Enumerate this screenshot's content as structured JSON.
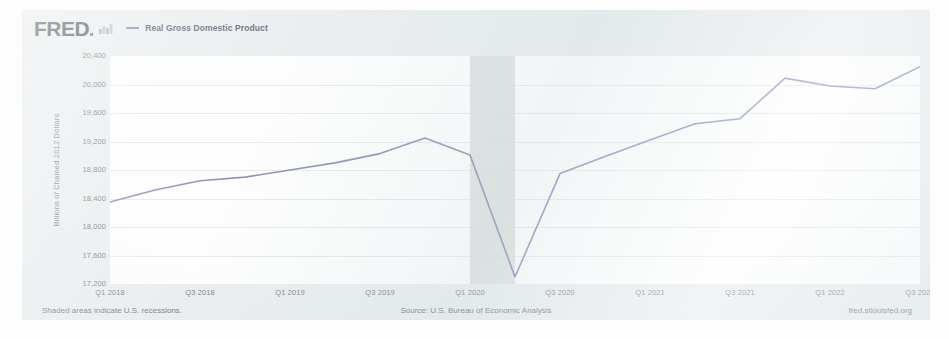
{
  "card": {
    "logo_text": "FRED",
    "logo_icon": "mini-bar-chart-icon",
    "legend_label": "Real Gross Domestic Product",
    "line_color": "#7178a8",
    "recession_band_color": "#d4d9d6",
    "plot_background": "#ffffff",
    "card_background": "#e9edef"
  },
  "footer": {
    "left": "Shaded areas indicate U.S. recessions.",
    "center": "Source: U.S. Bureau of Economic Analysis",
    "right": "fred.stlouisfed.org"
  },
  "chart_data": {
    "type": "line",
    "title": "",
    "xlabel": "",
    "ylabel": "Billions of Chained 2012 Dollars",
    "ylim": [
      17200,
      20400
    ],
    "ytick_labels": [
      "20,400",
      "20,000",
      "19,600",
      "19,200",
      "18,800",
      "18,400",
      "18,000",
      "17,600",
      "17,200"
    ],
    "ytick_values": [
      20400,
      20000,
      19600,
      19200,
      18800,
      18400,
      18000,
      17600,
      17200
    ],
    "xtick_labels": [
      "Q1 2018",
      "Q3 2018",
      "Q1 2019",
      "Q3 2019",
      "Q1 2020",
      "Q3 2020",
      "Q1 2021",
      "Q3 2021",
      "Q1 2022",
      "Q3 2022"
    ],
    "grid": "horizontal",
    "legend_position": "top-left",
    "shaded_regions": [
      {
        "label": "U.S. recession",
        "start": "2020-Q1",
        "end": "2020-Q2",
        "color": "#d4d9d6"
      }
    ],
    "series": [
      {
        "name": "Real Gross Domestic Product",
        "color": "#7178a8",
        "x": [
          "Q1 2018",
          "Q2 2018",
          "Q3 2018",
          "Q4 2018",
          "Q1 2019",
          "Q2 2019",
          "Q3 2019",
          "Q4 2019",
          "Q1 2020",
          "Q2 2020",
          "Q3 2020",
          "Q4 2020",
          "Q1 2021",
          "Q2 2021",
          "Q3 2021",
          "Q4 2021",
          "Q1 2022",
          "Q2 2022",
          "Q3 2022"
        ],
        "values": [
          18350,
          18520,
          18650,
          18700,
          18800,
          18900,
          19030,
          19250,
          19010,
          17300,
          18750,
          18990,
          19220,
          19450,
          19520,
          20090,
          19980,
          19940,
          20250
        ]
      }
    ]
  }
}
